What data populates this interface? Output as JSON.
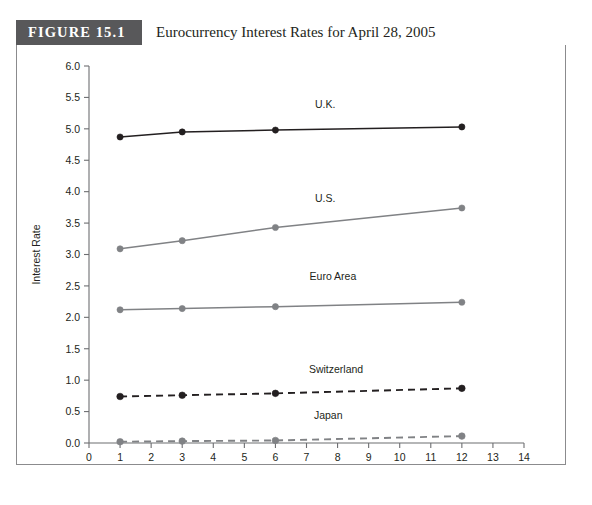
{
  "figure": {
    "number_label": "FIGURE 15.1",
    "title": "Eurocurrency Interest Rates for April 28, 2005",
    "header_bg": "#58585a",
    "header_text_color": "#ffffff",
    "border_color": "#8b8b8d"
  },
  "chart_data": {
    "type": "line",
    "title": "Eurocurrency Interest Rates for April 28, 2005",
    "xlabel": "Months Forward",
    "ylabel": "Interest Rate",
    "x": [
      1,
      3,
      6,
      12
    ],
    "xlim": [
      0,
      14
    ],
    "ylim": [
      0.0,
      6.0
    ],
    "xticks": [
      0,
      1,
      2,
      3,
      4,
      5,
      6,
      7,
      8,
      9,
      10,
      11,
      12,
      13,
      14
    ],
    "xtick_labels": [
      "0",
      "1",
      "2",
      "3",
      "4",
      "5",
      "6",
      "7",
      "8",
      "9",
      "10",
      "11",
      "12",
      "13",
      "14"
    ],
    "yticks": [
      0.0,
      0.5,
      1.0,
      1.5,
      2.0,
      2.5,
      3.0,
      3.5,
      4.0,
      4.5,
      5.0,
      5.5,
      6.0
    ],
    "ytick_labels": [
      "0.0",
      "0.5",
      "1.0",
      "1.5",
      "2.0",
      "2.5",
      "3.0",
      "3.5",
      "4.0",
      "4.5",
      "5.0",
      "5.5",
      "6.0"
    ],
    "grid": false,
    "legend_position": "inline-labels",
    "series": [
      {
        "name": "U.K.",
        "values": [
          4.87,
          4.95,
          4.98,
          5.03
        ],
        "color": "#231f20",
        "style": "solid",
        "marker": "filled-circle",
        "label_x": 7.6,
        "label_y": 5.33
      },
      {
        "name": "U.S.",
        "values": [
          3.09,
          3.22,
          3.43,
          3.74
        ],
        "color": "#808285",
        "style": "solid",
        "marker": "filled-circle",
        "label_x": 7.6,
        "label_y": 3.84
      },
      {
        "name": "Euro Area",
        "values": [
          2.12,
          2.14,
          2.17,
          2.24
        ],
        "color": "#808285",
        "style": "solid",
        "marker": "filled-circle",
        "label_x": 7.85,
        "label_y": 2.59
      },
      {
        "name": "Switzerland",
        "values": [
          0.74,
          0.76,
          0.79,
          0.87
        ],
        "color": "#231f20",
        "style": "dashed",
        "marker": "filled-circle",
        "label_x": 7.95,
        "label_y": 1.11
      },
      {
        "name": "Japan",
        "values": [
          0.02,
          0.03,
          0.04,
          0.11
        ],
        "color": "#808285",
        "style": "dashed",
        "marker": "filled-circle",
        "label_x": 7.7,
        "label_y": 0.38
      }
    ]
  }
}
